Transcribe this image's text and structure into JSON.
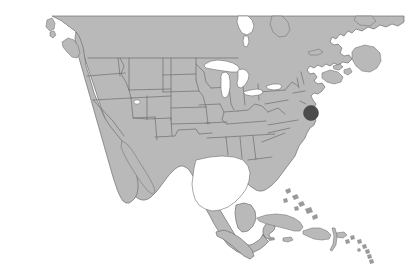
{
  "figure": {
    "kind": "map-image",
    "background_color": "#ffffff",
    "width": 410,
    "height": 279
  },
  "map": {
    "projection_note": "North America, conic",
    "land_fill_color": "#b9b9b9",
    "border_color": "#6f6f6f",
    "water_fill_color": "#ffffff",
    "top_crop_y": 16,
    "regions": [
      {
        "name": "Canada",
        "label": ""
      },
      {
        "name": "United States",
        "label": ""
      },
      {
        "name": "Mexico",
        "label": ""
      },
      {
        "name": "Cuba",
        "label": ""
      },
      {
        "name": "Hispaniola",
        "label": ""
      },
      {
        "name": "Puerto Rico",
        "label": ""
      },
      {
        "name": "Bahamas",
        "label": ""
      },
      {
        "name": "Lesser Antilles",
        "label": ""
      },
      {
        "name": "Newfoundland",
        "label": ""
      },
      {
        "name": "Nova Scotia",
        "label": ""
      },
      {
        "name": "Vancouver Island",
        "label": ""
      },
      {
        "name": "Baja California",
        "label": ""
      },
      {
        "name": "Yucatan Peninsula",
        "label": ""
      }
    ],
    "lakes": [
      {
        "name": "Lake Superior"
      },
      {
        "name": "Lake Michigan"
      },
      {
        "name": "Lake Huron"
      },
      {
        "name": "Lake Erie"
      },
      {
        "name": "Lake Ontario"
      },
      {
        "name": "Great Salt Lake"
      },
      {
        "name": "Hudson Bay inlet"
      }
    ]
  },
  "marker": {
    "name": "location-marker",
    "color": "#4c4c4c",
    "x": 311,
    "y": 113,
    "radius": 7.5,
    "region_hint": "Mid-Atlantic coast"
  }
}
